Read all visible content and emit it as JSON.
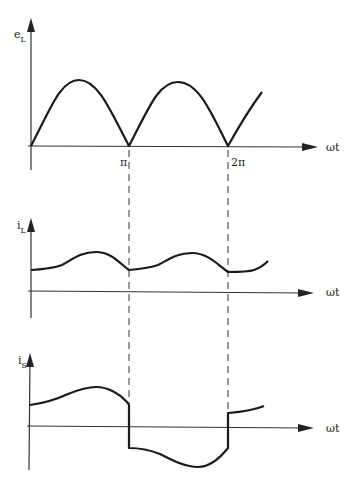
{
  "diagram": {
    "type": "waveform-timing-diagram",
    "panels": [
      {
        "id": "load-voltage",
        "y_label": "e",
        "y_label_sub": "L",
        "x_label": "ωt",
        "tick_labels": [
          "π",
          "2π"
        ],
        "description": "Full-wave rectified sine: arches from 0 to π and π to 2π, then rising beyond 2π"
      },
      {
        "id": "load-current",
        "y_label": "i",
        "y_label_sub": "L",
        "x_label": "ωt",
        "description": "Positive rippled current with minima at π and 2π"
      },
      {
        "id": "source-current",
        "y_label": "i",
        "y_label_sub": "S",
        "x_label": "ωt",
        "description": "Positive during 0–π, steps negative at π, mirrored negative ripple during π–2π, steps back positive at 2π"
      }
    ],
    "markers": {
      "pi_label": "π",
      "two_pi_label": "2π"
    }
  }
}
